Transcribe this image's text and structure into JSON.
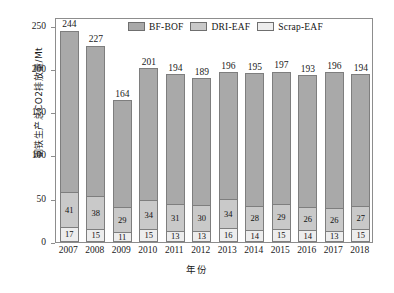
{
  "chart_data": {
    "type": "bar",
    "stacked": true,
    "title": "",
    "xlabel": "年份",
    "ylabel": "钢铁生产总CO2排放量/Mt",
    "categories": [
      "2007",
      "2008",
      "2009",
      "2010",
      "2011",
      "2012",
      "2013",
      "2014",
      "2015",
      "2016",
      "2017",
      "2018"
    ],
    "ylim": [
      0,
      260
    ],
    "yticks": [
      0,
      50,
      100,
      150,
      200,
      250
    ],
    "ytick_labels": [
      "0",
      "50",
      "100",
      "150",
      "200",
      "250"
    ],
    "grid": false,
    "legend_position": "top-center",
    "series": [
      {
        "name": "BF-BOF",
        "color": "#a9a9a9",
        "values": [
          186,
          174,
          124,
          152,
          150,
          146,
          146,
          153,
          153,
          153,
          157,
          152
        ],
        "labels": [
          "",
          "",
          "",
          "",
          "",
          "",
          "",
          "",
          "",
          "",
          "",
          ""
        ]
      },
      {
        "name": "DRI-EAF",
        "color": "#c9c9c9",
        "values": [
          41,
          38,
          29,
          34,
          31,
          30,
          34,
          28,
          29,
          26,
          26,
          27
        ],
        "labels": [
          "41",
          "38",
          "29",
          "34",
          "31",
          "30",
          "34",
          "28",
          "29",
          "26",
          "26",
          "27"
        ]
      },
      {
        "name": "Scrap-EAF",
        "color": "#ededed",
        "values": [
          17,
          15,
          11,
          15,
          13,
          13,
          16,
          14,
          15,
          14,
          13,
          15
        ],
        "labels": [
          "17",
          "15",
          "11",
          "15",
          "13",
          "13",
          "16",
          "14",
          "15",
          "14",
          "13",
          "15"
        ]
      }
    ],
    "totals": [
      244,
      227,
      164,
      201,
      194,
      189,
      196,
      195,
      197,
      193,
      196,
      194
    ],
    "total_labels": [
      "244",
      "227",
      "164",
      "201",
      "194",
      "189",
      "196",
      "195",
      "197",
      "193",
      "196",
      "194"
    ]
  },
  "legend": {
    "items": [
      {
        "label": "BF-BOF",
        "color": "#a9a9a9"
      },
      {
        "label": "DRI-EAF",
        "color": "#c9c9c9"
      },
      {
        "label": "Scrap-EAF",
        "color": "#ededed"
      }
    ]
  },
  "axes": {
    "y_title": "钢铁生产总CO2排放量/Mt",
    "x_title": "年份"
  },
  "colors": {
    "frame": "#8d8d8d",
    "background": "#ffffff",
    "text": "#1a1a1a"
  }
}
